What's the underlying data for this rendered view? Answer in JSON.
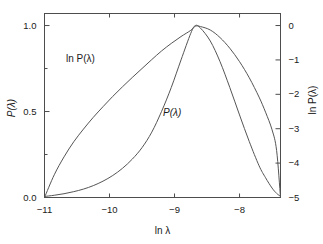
{
  "chart_data": {
    "type": "line",
    "title": "",
    "xlabel": "ln λ",
    "ylabel": "P(λ)",
    "y2label": "ln P(λ)",
    "xlim": [
      -11.0,
      -7.37
    ],
    "ylim": [
      0.0,
      1.07
    ],
    "y2lim": [
      -5.0,
      0.35
    ],
    "grid": false,
    "legend": "inline-annotations",
    "xticks": [
      -11,
      -10,
      -9,
      -8
    ],
    "xticklabels": [
      "−11",
      "−10",
      "−9",
      "−8"
    ],
    "yticks": [
      0.0,
      0.5,
      1.0
    ],
    "yticklabels": [
      "0.0",
      "0.5",
      "1.0"
    ],
    "yminorticks": [
      0.25,
      0.75
    ],
    "y2ticks": [
      0,
      -1,
      -2,
      -3,
      -4,
      -5
    ],
    "y2ticklabels": [
      "0",
      "−1",
      "−2",
      "−3",
      "−4",
      "−5"
    ],
    "annotations": [
      {
        "text": "ln  P(λ)",
        "x": -10.25,
        "y_axis": "right",
        "y": -0.55
      },
      {
        "text": "P(λ)",
        "x": -9.4,
        "y_axis": "left",
        "y": 0.47
      }
    ],
    "series": [
      {
        "name": "P(λ)",
        "axis": "left",
        "color": "#555555",
        "x": [
          -11.0,
          -10.85,
          -10.7,
          -10.55,
          -10.4,
          -10.25,
          -10.1,
          -9.95,
          -9.8,
          -9.65,
          -9.5,
          -9.35,
          -9.2,
          -9.05,
          -8.9,
          -8.75,
          -8.68,
          -8.6,
          -8.45,
          -8.3,
          -8.15,
          -8.0,
          -7.85,
          -7.7,
          -7.6,
          -7.5,
          -7.43,
          -7.37
        ],
        "values": [
          0.006,
          0.013,
          0.022,
          0.034,
          0.049,
          0.069,
          0.095,
          0.128,
          0.17,
          0.223,
          0.29,
          0.38,
          0.5,
          0.64,
          0.8,
          0.955,
          1.0,
          0.985,
          0.91,
          0.79,
          0.64,
          0.48,
          0.325,
          0.185,
          0.115,
          0.055,
          0.024,
          0.007
        ]
      },
      {
        "name": "ln P(λ)",
        "axis": "right",
        "color": "#555555",
        "x": [
          -11.0,
          -10.85,
          -10.7,
          -10.55,
          -10.4,
          -10.25,
          -10.1,
          -9.95,
          -9.8,
          -9.65,
          -9.5,
          -9.35,
          -9.2,
          -9.05,
          -8.9,
          -8.75,
          -8.68,
          -8.6,
          -8.45,
          -8.3,
          -8.15,
          -8.0,
          -7.85,
          -7.7,
          -7.6,
          -7.5,
          -7.43,
          -7.37
        ],
        "values": [
          -5.0,
          -4.34,
          -3.82,
          -3.38,
          -3.01,
          -2.67,
          -2.36,
          -2.06,
          -1.78,
          -1.51,
          -1.25,
          -0.99,
          -0.74,
          -0.52,
          -0.32,
          -0.14,
          -0.02,
          -0.03,
          -0.13,
          -0.35,
          -0.66,
          -1.05,
          -1.52,
          -2.08,
          -2.52,
          -3.03,
          -3.63,
          -5.0
        ]
      }
    ]
  },
  "axes": {
    "x_title": "ln λ",
    "y_left_title": "P(λ)",
    "y_right_title": "ln P(λ)"
  },
  "labels": {
    "ln_p_curve": "ln  P(λ)",
    "p_curve": "P(λ)"
  },
  "style": {
    "frame_color": "#4d4d4d",
    "curve_color": "#555555",
    "text_color": "#1a1a1a",
    "background": "#ffffff"
  }
}
